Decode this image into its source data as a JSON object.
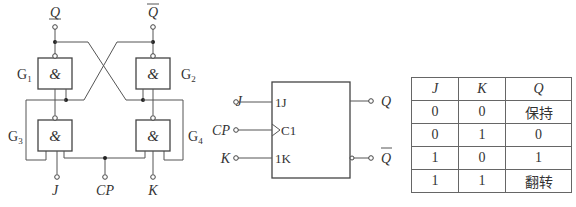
{
  "gate_circuit": {
    "gates": [
      {
        "id": "G1",
        "symbol": "&",
        "label_main": "G",
        "label_sub": "1"
      },
      {
        "id": "G2",
        "symbol": "&",
        "label_main": "G",
        "label_sub": "2"
      },
      {
        "id": "G3",
        "symbol": "&",
        "label_main": "G",
        "label_sub": "3"
      },
      {
        "id": "G4",
        "symbol": "&",
        "label_main": "G",
        "label_sub": "4"
      }
    ],
    "outputs": {
      "q": "Q",
      "q_bar": "Q"
    },
    "inputs": {
      "j": "J",
      "cp": "CP",
      "k": "K"
    }
  },
  "logic_symbol": {
    "pins_left": {
      "j": "J",
      "cp": "CP",
      "k": "K"
    },
    "pins_inner": {
      "j": "1J",
      "c": "C1",
      "k": "1K"
    },
    "pins_right": {
      "q": "Q",
      "q_bar": "Q"
    }
  },
  "truth_table": {
    "headers": [
      "J",
      "K",
      "Q"
    ],
    "rows": [
      [
        "0",
        "0",
        "保持"
      ],
      [
        "0",
        "1",
        "0"
      ],
      [
        "1",
        "0",
        "1"
      ],
      [
        "1",
        "1",
        "翻转"
      ]
    ]
  }
}
